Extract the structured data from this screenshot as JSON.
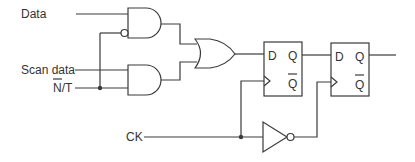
{
  "diagram": {
    "type": "scan flip-flop circuit",
    "inputs": {
      "data": "Data",
      "scan_data": "Scan data",
      "nt": "N/T",
      "nt_overlined": "N",
      "ck": "CK"
    },
    "flipflops": [
      {
        "d": "D",
        "q": "Q",
        "qbar": "Q"
      },
      {
        "d": "D",
        "q": "Q",
        "qbar": "Q"
      }
    ],
    "components": [
      "AND gate (inverted input)",
      "AND gate",
      "OR gate",
      "D flip-flop 1",
      "D flip-flop 2",
      "Inverter"
    ],
    "colors": {
      "line": "#3a3a3a",
      "text": "#333333",
      "background": "#ffffff"
    }
  }
}
